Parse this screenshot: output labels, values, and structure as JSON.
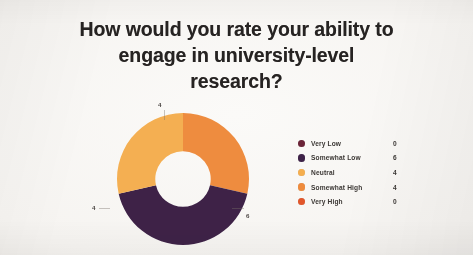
{
  "slide": {
    "background_color": "#f6f4f1",
    "title_color": "#262322"
  },
  "title": {
    "full": "How would you rate your ability to engage in university-level research?",
    "line1": "How would you rate your ability to",
    "line2": "engage in university-level",
    "line3": "research?"
  },
  "legend": {
    "position": "right",
    "rows": [
      {
        "label": "Very Low",
        "value": "0",
        "color": "#6b2438"
      },
      {
        "label": "Somewhat Low",
        "value": "6",
        "color": "#3e2248"
      },
      {
        "label": "Neutral",
        "value": "4",
        "color": "#f5ae4e"
      },
      {
        "label": "Somewhat High",
        "value": "4",
        "color": "#ef8b3c"
      },
      {
        "label": "Very High",
        "value": "0",
        "color": "#e2562a"
      }
    ]
  },
  "callouts": {
    "top": "4",
    "left": "4",
    "bottom_right": "6"
  },
  "chart_data": {
    "type": "pie",
    "variant": "donut",
    "title": "How would you rate your ability to engage in university-level research?",
    "xlabel": "",
    "ylabel": "",
    "grid": false,
    "legend_position": "right",
    "total": 14,
    "hole_ratio": 0.42,
    "start_angle_deg": 0,
    "direction": "clockwise",
    "categories": [
      "Very Low",
      "Somewhat Low",
      "Neutral",
      "Somewhat High",
      "Very High"
    ],
    "values": [
      0,
      6,
      4,
      4,
      0
    ],
    "colors": [
      "#6b2438",
      "#3e2248",
      "#f5ae4e",
      "#ef8b3c",
      "#e2562a"
    ],
    "slices": [
      {
        "label": "Very Low",
        "value": 0,
        "percent": 0.0,
        "color": "#6b2438",
        "rendered": false
      },
      {
        "label": "Somewhat High",
        "value": 4,
        "percent": 28.6,
        "color": "#ef8b3c",
        "rendered": true,
        "start_deg": 0,
        "end_deg": 102.9,
        "data_label": "4"
      },
      {
        "label": "Somewhat Low",
        "value": 6,
        "percent": 42.9,
        "color": "#3e2248",
        "rendered": true,
        "start_deg": 102.9,
        "end_deg": 257.1,
        "data_label": "6"
      },
      {
        "label": "Neutral",
        "value": 4,
        "percent": 28.6,
        "color": "#f5ae4e",
        "rendered": true,
        "start_deg": 257.1,
        "end_deg": 360.0,
        "data_label": "4"
      },
      {
        "label": "Very High",
        "value": 0,
        "percent": 0.0,
        "color": "#e2562a",
        "rendered": false
      }
    ],
    "data_labels": [
      "4",
      "6",
      "4"
    ]
  }
}
